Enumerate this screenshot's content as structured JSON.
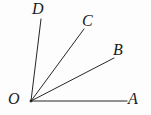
{
  "figure": {
    "type": "geometry-diagram",
    "width": 151,
    "height": 115,
    "background_color": "#fdfdfd",
    "stroke_color": "#262626",
    "stroke_width": 1,
    "vertex": {
      "name": "O",
      "x": 31,
      "y": 101
    },
    "rays": [
      {
        "name": "ray-OA",
        "from": "O",
        "to": "A",
        "x1": 31,
        "y1": 101,
        "x2": 127,
        "y2": 101
      },
      {
        "name": "ray-OB",
        "from": "O",
        "to": "B",
        "x1": 31,
        "y1": 101,
        "x2": 114,
        "y2": 58
      },
      {
        "name": "ray-OC",
        "from": "O",
        "to": "C",
        "x1": 31,
        "y1": 101,
        "x2": 84,
        "y2": 29
      },
      {
        "name": "ray-OD",
        "from": "O",
        "to": "D",
        "x1": 31,
        "y1": 101,
        "x2": 41,
        "y2": 19
      }
    ],
    "labels": [
      {
        "name": "label-O",
        "text": "O",
        "x": 8,
        "y": 91
      },
      {
        "name": "label-A",
        "text": "A",
        "x": 128,
        "y": 91
      },
      {
        "name": "label-B",
        "text": "B",
        "x": 113,
        "y": 42
      },
      {
        "name": "label-C",
        "text": "C",
        "x": 82,
        "y": 13
      },
      {
        "name": "label-D",
        "text": "D",
        "x": 32,
        "y": 1
      }
    ]
  }
}
